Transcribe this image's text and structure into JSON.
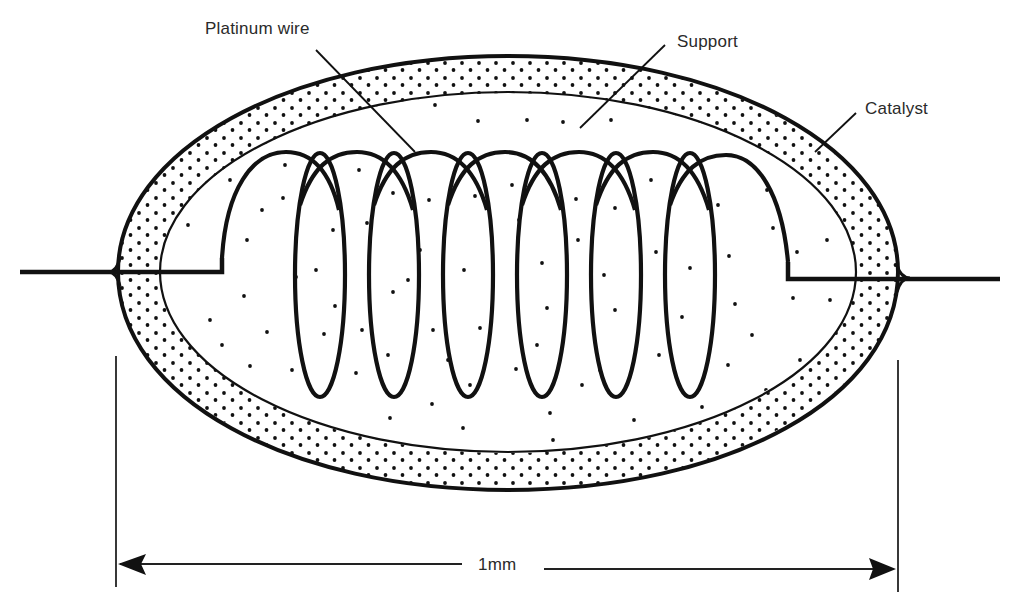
{
  "figure": {
    "colors": {
      "ink": "#111111",
      "text": "#2a2a2a",
      "background": "#ffffff"
    }
  },
  "labels": {
    "platinum_wire": "Platinum wire",
    "support": "Support",
    "catalyst": "Catalyst",
    "dimension": "1mm"
  },
  "components": [
    {
      "id": "platinum-wire",
      "label": "Platinum wire",
      "shape": "helical coil",
      "turns": 6
    },
    {
      "id": "support",
      "label": "Support",
      "shape": "inner ellipse, sparse dots"
    },
    {
      "id": "catalyst",
      "label": "Catalyst",
      "shape": "outer ellipse shell, dense dots"
    }
  ],
  "dimension": {
    "value": "1mm",
    "spans": "overall bead width"
  }
}
